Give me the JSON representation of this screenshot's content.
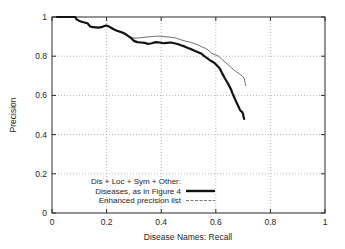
{
  "chart_data": {
    "type": "line",
    "title": "",
    "xlabel": "Disease Names:  Recall",
    "ylabel": "Precision",
    "xlim": [
      0,
      1
    ],
    "ylim": [
      0,
      1
    ],
    "xticks": [
      "0",
      "0.2",
      "0.4",
      "0.6",
      "0.8",
      "1"
    ],
    "yticks": [
      "0",
      "0.2",
      "0.4",
      "0.6",
      "0.8",
      "1"
    ],
    "xtick_values": [
      0,
      0.2,
      0.4,
      0.6,
      0.8,
      1
    ],
    "ytick_values": [
      0,
      0.2,
      0.4,
      0.6,
      0.8,
      1
    ],
    "grid": true,
    "legend_position": "bottom-center-inside",
    "legend_title": "Dis + Loc + Sym + Other:",
    "series": [
      {
        "name": "Diseases, as in Figure 4",
        "style": "solid-thick",
        "color": "#121212",
        "points": [
          [
            0.018,
            1.0
          ],
          [
            0.06,
            1.0
          ],
          [
            0.085,
            1.0
          ],
          [
            0.09,
            0.988
          ],
          [
            0.1,
            0.98
          ],
          [
            0.115,
            0.973
          ],
          [
            0.13,
            0.968
          ],
          [
            0.14,
            0.952
          ],
          [
            0.15,
            0.948
          ],
          [
            0.17,
            0.946
          ],
          [
            0.185,
            0.95
          ],
          [
            0.198,
            0.957
          ],
          [
            0.208,
            0.952
          ],
          [
            0.218,
            0.944
          ],
          [
            0.228,
            0.936
          ],
          [
            0.238,
            0.93
          ],
          [
            0.25,
            0.925
          ],
          [
            0.262,
            0.918
          ],
          [
            0.272,
            0.91
          ],
          [
            0.282,
            0.9
          ],
          [
            0.292,
            0.89
          ],
          [
            0.3,
            0.878
          ],
          [
            0.312,
            0.872
          ],
          [
            0.325,
            0.87
          ],
          [
            0.34,
            0.868
          ],
          [
            0.352,
            0.862
          ],
          [
            0.365,
            0.866
          ],
          [
            0.38,
            0.872
          ],
          [
            0.395,
            0.87
          ],
          [
            0.408,
            0.866
          ],
          [
            0.42,
            0.868
          ],
          [
            0.435,
            0.87
          ],
          [
            0.448,
            0.866
          ],
          [
            0.46,
            0.862
          ],
          [
            0.472,
            0.856
          ],
          [
            0.485,
            0.85
          ],
          [
            0.498,
            0.842
          ],
          [
            0.51,
            0.836
          ],
          [
            0.522,
            0.828
          ],
          [
            0.535,
            0.82
          ],
          [
            0.548,
            0.812
          ],
          [
            0.558,
            0.8
          ],
          [
            0.568,
            0.79
          ],
          [
            0.578,
            0.78
          ],
          [
            0.588,
            0.772
          ],
          [
            0.598,
            0.762
          ],
          [
            0.606,
            0.75
          ],
          [
            0.614,
            0.738
          ],
          [
            0.62,
            0.722
          ],
          [
            0.626,
            0.706
          ],
          [
            0.632,
            0.69
          ],
          [
            0.638,
            0.676
          ],
          [
            0.644,
            0.662
          ],
          [
            0.65,
            0.646
          ],
          [
            0.656,
            0.63
          ],
          [
            0.66,
            0.614
          ],
          [
            0.665,
            0.598
          ],
          [
            0.67,
            0.582
          ],
          [
            0.675,
            0.566
          ],
          [
            0.68,
            0.552
          ],
          [
            0.684,
            0.54
          ],
          [
            0.688,
            0.528
          ],
          [
            0.692,
            0.52
          ],
          [
            0.696,
            0.516
          ],
          [
            0.7,
            0.505
          ],
          [
            0.702,
            0.488
          ],
          [
            0.704,
            0.48
          ]
        ]
      },
      {
        "name": "Enhanced precision list",
        "style": "dotted-thin",
        "color": "#5e5e5e",
        "points": [
          [
            0.018,
            1.0
          ],
          [
            0.06,
            1.0
          ],
          [
            0.085,
            1.0
          ],
          [
            0.09,
            0.988
          ],
          [
            0.1,
            0.98
          ],
          [
            0.115,
            0.973
          ],
          [
            0.13,
            0.968
          ],
          [
            0.14,
            0.952
          ],
          [
            0.15,
            0.948
          ],
          [
            0.17,
            0.946
          ],
          [
            0.185,
            0.952
          ],
          [
            0.198,
            0.958
          ],
          [
            0.21,
            0.95
          ],
          [
            0.222,
            0.94
          ],
          [
            0.235,
            0.93
          ],
          [
            0.248,
            0.922
          ],
          [
            0.26,
            0.916
          ],
          [
            0.272,
            0.908
          ],
          [
            0.284,
            0.9
          ],
          [
            0.296,
            0.894
          ],
          [
            0.308,
            0.892
          ],
          [
            0.322,
            0.894
          ],
          [
            0.336,
            0.896
          ],
          [
            0.35,
            0.898
          ],
          [
            0.365,
            0.9
          ],
          [
            0.38,
            0.902
          ],
          [
            0.395,
            0.902
          ],
          [
            0.41,
            0.9
          ],
          [
            0.425,
            0.898
          ],
          [
            0.44,
            0.896
          ],
          [
            0.455,
            0.892
          ],
          [
            0.468,
            0.886
          ],
          [
            0.48,
            0.88
          ],
          [
            0.492,
            0.876
          ],
          [
            0.505,
            0.872
          ],
          [
            0.518,
            0.866
          ],
          [
            0.53,
            0.86
          ],
          [
            0.542,
            0.852
          ],
          [
            0.552,
            0.846
          ],
          [
            0.562,
            0.84
          ],
          [
            0.572,
            0.832
          ],
          [
            0.58,
            0.82
          ],
          [
            0.59,
            0.812
          ],
          [
            0.6,
            0.806
          ],
          [
            0.61,
            0.8
          ],
          [
            0.618,
            0.79
          ],
          [
            0.626,
            0.78
          ],
          [
            0.634,
            0.77
          ],
          [
            0.642,
            0.76
          ],
          [
            0.65,
            0.75
          ],
          [
            0.658,
            0.74
          ],
          [
            0.666,
            0.73
          ],
          [
            0.674,
            0.722
          ],
          [
            0.682,
            0.714
          ],
          [
            0.69,
            0.706
          ],
          [
            0.696,
            0.7
          ],
          [
            0.7,
            0.694
          ],
          [
            0.704,
            0.686
          ],
          [
            0.706,
            0.672
          ],
          [
            0.708,
            0.66
          ],
          [
            0.71,
            0.65
          ]
        ]
      }
    ]
  },
  "legend": {
    "title": "Dis + Loc + Sym + Other:",
    "entries": [
      {
        "label": "Diseases, as in Figure 4"
      },
      {
        "label": "Enhanced precision list"
      }
    ]
  },
  "axes": {
    "x_title": "Disease Names:  Recall",
    "y_title": "Precision"
  }
}
